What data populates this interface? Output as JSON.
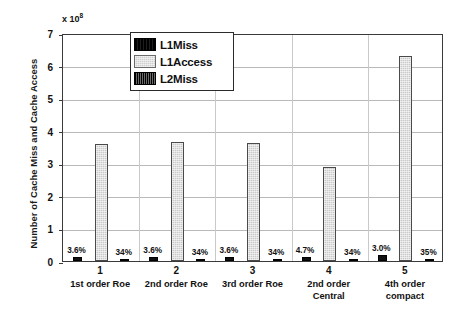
{
  "chart_data": {
    "type": "bar",
    "title": "",
    "xlabel": "",
    "ylabel": "Number of Cache Miss and Cache Access",
    "y_exponent_prefix": "x 10",
    "y_exponent": "8",
    "ylim": [
      0,
      7
    ],
    "yticks": [
      "0",
      "1",
      "2",
      "3",
      "4",
      "5",
      "6",
      "7"
    ],
    "grid": true,
    "legend_position": "top-center",
    "categories": [
      "1",
      "2",
      "3",
      "4",
      "5"
    ],
    "category_sublabels": [
      [
        "1st order Roe"
      ],
      [
        "2nd order Roe"
      ],
      [
        "3rd order Roe"
      ],
      [
        "2nd order",
        "Central"
      ],
      [
        "4th order",
        "compact"
      ]
    ],
    "series": [
      {
        "name": "L1Miss",
        "color": "#111111",
        "values": [
          0.13,
          0.13,
          0.13,
          0.136,
          0.189
        ],
        "labels": [
          "3.6%",
          "3.6%",
          "3.6%",
          "4.7%",
          "3.0%"
        ]
      },
      {
        "name": "L1Access",
        "color": "#c9c9c9",
        "values": [
          3.6,
          3.65,
          3.62,
          2.9,
          6.3
        ],
        "labels": [
          "",
          "",
          "",
          "",
          ""
        ]
      },
      {
        "name": "L2Miss",
        "color": "#161616",
        "values": [
          0.044,
          0.044,
          0.044,
          0.046,
          0.066
        ],
        "labels": [
          "34%",
          "34%",
          "34%",
          "34%",
          "35%"
        ]
      }
    ]
  },
  "legend": {
    "items": [
      {
        "label": "L1Miss",
        "swatch": "l1miss"
      },
      {
        "label": "L1Access",
        "swatch": "l1access"
      },
      {
        "label": "L2Miss",
        "swatch": "l2miss"
      }
    ]
  }
}
